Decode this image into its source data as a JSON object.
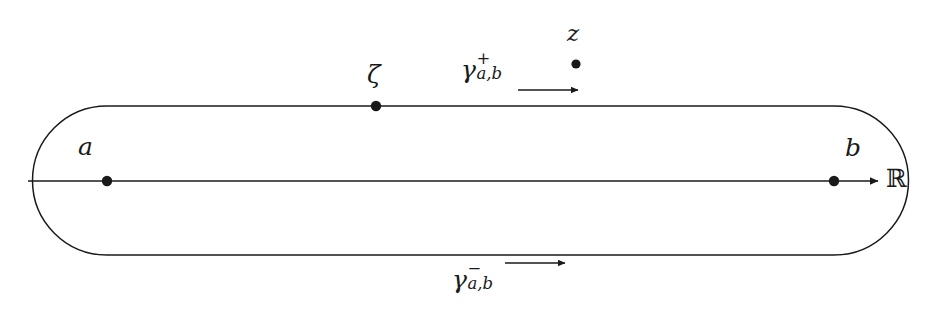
{
  "figure": {
    "background_color": "#ffffff",
    "stroke_color": "#1a1a1a",
    "width": 942,
    "height": 309
  },
  "axis": {
    "name": "real-axis",
    "label": "ℝ",
    "y": 181,
    "x_start": 28,
    "x_end": 878,
    "has_arrowhead": true
  },
  "contour": {
    "name": "stadium-contour",
    "left_x": 107,
    "right_x": 834,
    "top_y": 106,
    "bottom_y": 255,
    "corner_radius": 75
  },
  "points": [
    {
      "name": "point-a",
      "label": "a",
      "x": 107,
      "y": 181,
      "label_x": 78,
      "label_y": 134
    },
    {
      "name": "point-b",
      "label": "b",
      "x": 834,
      "y": 181,
      "label_x": 845,
      "label_y": 135
    },
    {
      "name": "point-zeta",
      "label": "ζ",
      "x": 376,
      "y": 106,
      "label_x": 367,
      "label_y": 62
    },
    {
      "name": "point-z",
      "label": "z",
      "x": 576,
      "y": 64,
      "label_x": 567,
      "label_y": 22
    }
  ],
  "path_labels": [
    {
      "name": "upper-path-label",
      "base": "γ",
      "superscript": "+",
      "subscript": "a,b",
      "arrow": {
        "name": "upper-direction-arrow",
        "x_start": 518,
        "x_end": 578,
        "y": 90,
        "direction": "right"
      }
    },
    {
      "name": "lower-path-label",
      "base": "γ",
      "superscript": "−",
      "subscript": "a,b",
      "arrow": {
        "name": "lower-direction-arrow",
        "x_start": 505,
        "x_end": 565,
        "y": 263,
        "direction": "right"
      }
    }
  ]
}
